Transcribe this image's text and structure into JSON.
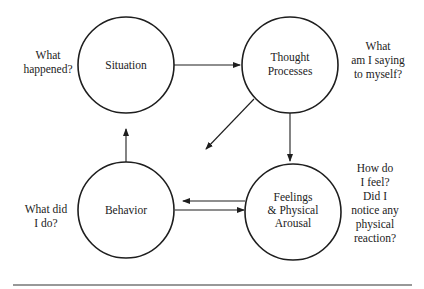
{
  "diagram": {
    "type": "cognitive-behavioral cycle",
    "nodes": [
      {
        "id": "situation",
        "label": [
          "Situation"
        ],
        "question": [
          "What",
          "happened?"
        ]
      },
      {
        "id": "thought",
        "label": [
          "Thought",
          "Processes"
        ],
        "question": [
          "What",
          "am I saying",
          "to myself?"
        ]
      },
      {
        "id": "behavior",
        "label": [
          "Behavior"
        ],
        "question": [
          "What did",
          "I do?"
        ]
      },
      {
        "id": "feelings",
        "label": [
          "Feelings",
          "& Physical",
          "Arousal"
        ],
        "question": [
          "How do",
          "I feel?",
          "Did I",
          "notice any",
          "physical",
          "reaction?"
        ]
      }
    ],
    "edges": [
      {
        "from": "situation",
        "to": "thought"
      },
      {
        "from": "thought",
        "to": "feelings"
      },
      {
        "from": "thought",
        "to": "behavior"
      },
      {
        "from": "feelings",
        "to": "behavior"
      },
      {
        "from": "behavior",
        "to": "feelings"
      },
      {
        "from": "behavior",
        "to": "situation"
      }
    ],
    "colors": {
      "stroke": "#1e1e1e",
      "text": "#222222",
      "background": "#ffffff"
    }
  }
}
